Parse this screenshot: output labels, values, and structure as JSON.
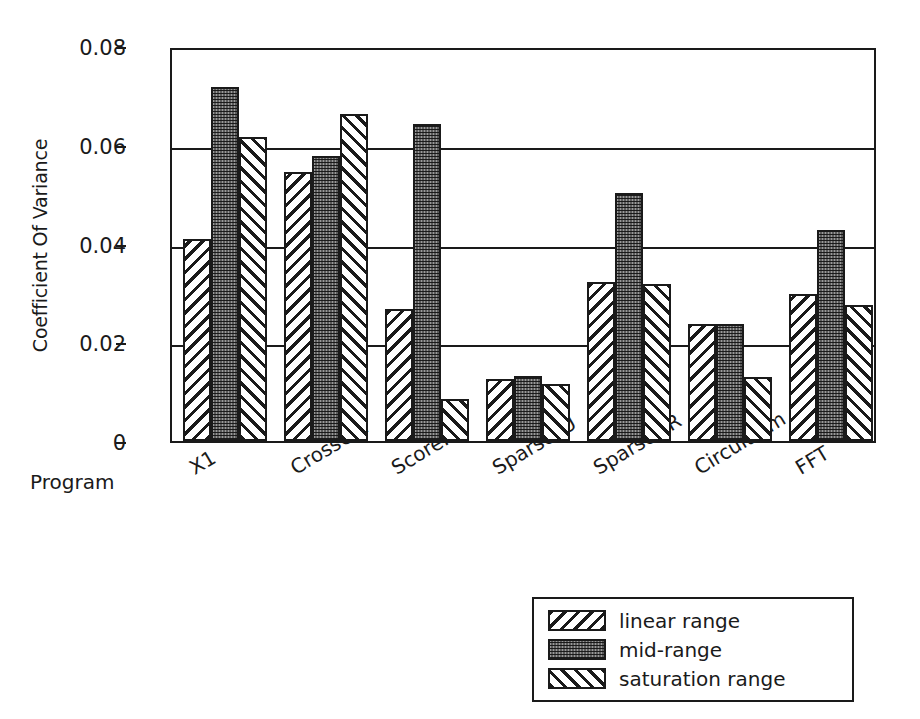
{
  "chart_data": {
    "type": "bar",
    "title": "",
    "subtitle": "",
    "xlabel": "Program",
    "ylabel": "Coefficient Of Variance",
    "categories": [
      "X1",
      "CrossCor",
      "Score.",
      "SparseLU",
      "SparseQR",
      "CircuitSim",
      "FFT"
    ],
    "series": [
      {
        "name": "linear range",
        "pattern": "backslash-hatch",
        "values": [
          0.041,
          0.0545,
          0.0268,
          0.0125,
          0.0322,
          0.0238,
          0.0298
        ]
      },
      {
        "name": "mid-range",
        "pattern": "stipple",
        "values": [
          0.0718,
          0.0578,
          0.0642,
          0.0132,
          0.0503,
          0.0238,
          0.0428
        ]
      },
      {
        "name": "saturation range",
        "pattern": "forward-hatch",
        "values": [
          0.0615,
          0.0662,
          0.0085,
          0.0115,
          0.0318,
          0.013,
          0.0275
        ]
      }
    ],
    "ylim": [
      0,
      0.08
    ],
    "yticks": [
      0,
      0.02,
      0.04,
      0.06,
      0.08
    ],
    "ytick_labels": [
      "0",
      "0.02",
      "0.04",
      "0.06",
      "0.08"
    ],
    "grid": "horizontal",
    "legend_position": "bottom-right",
    "legend_entries": [
      "linear range",
      "mid-range",
      "saturation range"
    ],
    "xtick_label_rotation": -31,
    "colors": {
      "line": "#1a1a1a",
      "background": "#ffffff",
      "stipple_fill": "#9a9a9a",
      "hatch_fill": "#ffffff"
    }
  }
}
